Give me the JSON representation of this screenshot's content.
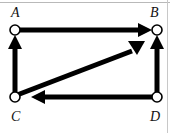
{
  "diagram": {
    "type": "directed-graph",
    "background_color": "#ffffff",
    "edge_color": "#000000",
    "vertex_fill_color": "#ffffff",
    "vertex_stroke_color": "#000000",
    "frame_color": "#b9b9b9",
    "vertices": [
      {
        "id": "A",
        "label": "A",
        "cx": 15,
        "cy": 30,
        "r": 5,
        "label_x": 11,
        "label_y": 6
      },
      {
        "id": "B",
        "label": "B",
        "cx": 157,
        "cy": 30,
        "r": 5,
        "label_x": 150,
        "label_y": 6
      },
      {
        "id": "C",
        "label": "C",
        "cx": 15,
        "cy": 97,
        "r": 5,
        "label_x": 11,
        "label_y": 110
      },
      {
        "id": "D",
        "label": "D",
        "cx": 157,
        "cy": 97,
        "r": 5,
        "label_x": 150,
        "label_y": 110
      }
    ],
    "edges": [
      {
        "id": "C-A",
        "from": "C",
        "to": "A",
        "direction": "up",
        "arrowhead": "at-A",
        "orientation": "vertical"
      },
      {
        "id": "A-B",
        "from": "A",
        "to": "B",
        "direction": "right",
        "arrowhead": "at-B",
        "orientation": "horizontal"
      },
      {
        "id": "C-B",
        "from": "C",
        "to": "B",
        "direction": "up-right",
        "arrowhead": "at-B",
        "orientation": "diagonal"
      },
      {
        "id": "D-B",
        "from": "D",
        "to": "B",
        "direction": "up",
        "arrowhead": "at-B",
        "orientation": "vertical"
      },
      {
        "id": "D-C",
        "from": "D",
        "to": "C",
        "direction": "left",
        "arrowhead": "at-C",
        "orientation": "horizontal"
      }
    ],
    "edge_width": 5,
    "arrowhead_length": 13,
    "arrowhead_half_width": 8
  }
}
